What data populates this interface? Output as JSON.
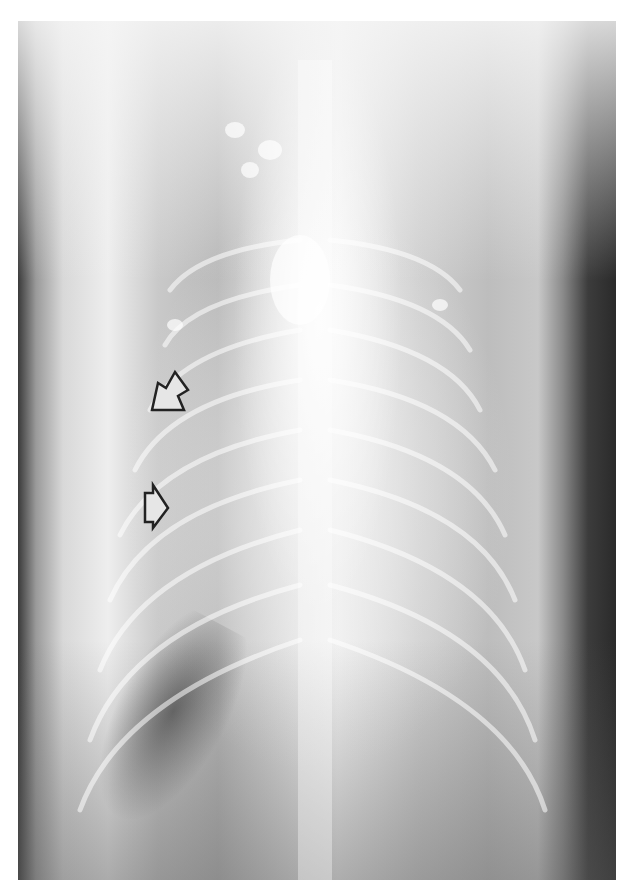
{
  "image": {
    "type": "radiograph",
    "view": "ventrodorsal thoracic",
    "description": "Grayscale thoracic X-ray with two outlined arrows marking a region along the left thoracic wall"
  },
  "annotations": [
    {
      "id": "arrow-1",
      "shape": "outlined-arrow",
      "direction": "down-left",
      "tip": [
        152,
        410
      ],
      "color": "#222222"
    },
    {
      "id": "arrow-2",
      "shape": "outlined-arrow",
      "direction": "right",
      "tip": [
        168,
        508
      ],
      "color": "#222222"
    }
  ],
  "colors": {
    "page_background": "#ffffff",
    "film_dark": "#2a2a2a",
    "film_light": "#f2f2f2",
    "arrow_outline": "#222222"
  }
}
